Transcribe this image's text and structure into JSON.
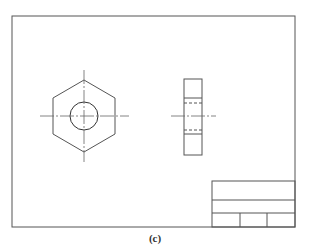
{
  "figure": {
    "caption": "(c)",
    "colors": {
      "line": "#555555",
      "center_line": "#666666"
    }
  },
  "sheet": {
    "border": {
      "x": 12,
      "y": 16,
      "width": 283,
      "height": 211
    }
  },
  "front_view": {
    "name": "hexagon-front-view",
    "center": [
      84,
      116
    ],
    "hex_radius": 36,
    "hole_radius": 14
  },
  "side_view": {
    "name": "nut-side-view",
    "x": 184,
    "y": 79,
    "width": 18,
    "height": 76
  },
  "title_block": {
    "x": 212,
    "y": 181,
    "width": 83,
    "height": 46,
    "rows_y": [
      181,
      200,
      213,
      227
    ],
    "bottom_dividers_x": [
      240,
      267
    ]
  }
}
